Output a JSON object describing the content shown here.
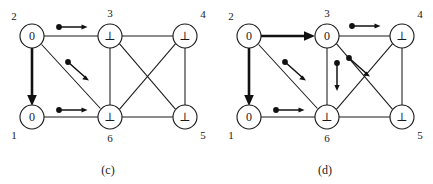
{
  "figure": {
    "background_color": "#ffffff",
    "ink_color": "#1a1a1a",
    "panels": [
      {
        "id": "c",
        "caption": "(c)",
        "nodes": [
          {
            "id": "2",
            "value": "0",
            "cx": 32,
            "cy": 36,
            "r": 12,
            "label_x": 14,
            "label_y": 17
          },
          {
            "id": "3",
            "value": "⊥",
            "cx": 110,
            "cy": 36,
            "r": 12,
            "label_x": 110,
            "label_y": 14
          },
          {
            "id": "4",
            "value": "⊥",
            "cx": 185,
            "cy": 36,
            "r": 12,
            "label_x": 203,
            "label_y": 15
          },
          {
            "id": "1",
            "value": "0",
            "cx": 32,
            "cy": 117,
            "r": 12,
            "label_x": 14,
            "label_y": 136
          },
          {
            "id": "6",
            "value": "⊥",
            "cx": 110,
            "cy": 117,
            "r": 12,
            "label_x": 110,
            "label_y": 139
          },
          {
            "id": "5",
            "value": "⊥",
            "cx": 185,
            "cy": 117,
            "r": 12,
            "label_x": 203,
            "label_y": 136
          }
        ],
        "edges": [
          {
            "from": "2",
            "to": "3",
            "style": "plain"
          },
          {
            "from": "3",
            "to": "4",
            "style": "plain"
          },
          {
            "from": "2",
            "to": "6",
            "style": "plain"
          },
          {
            "from": "3",
            "to": "6",
            "style": "plain"
          },
          {
            "from": "3",
            "to": "5",
            "style": "plain"
          },
          {
            "from": "4",
            "to": "6",
            "style": "plain"
          },
          {
            "from": "4",
            "to": "5",
            "style": "plain"
          },
          {
            "from": "1",
            "to": "6",
            "style": "plain"
          },
          {
            "from": "6",
            "to": "5",
            "style": "plain"
          },
          {
            "from": "2",
            "to": "1",
            "style": "bold-arrow"
          }
        ],
        "message_arrows": [
          {
            "from": "2",
            "to": "3",
            "direction": "right",
            "x1": 57,
            "y1": 27,
            "x2": 85,
            "y2": 27
          },
          {
            "from": "2",
            "to": "6",
            "direction": "down-right",
            "x1": 67,
            "y1": 61,
            "x2": 88,
            "y2": 79
          },
          {
            "from": "1",
            "to": "6",
            "direction": "right",
            "x1": 57,
            "y1": 110,
            "x2": 85,
            "y2": 110
          }
        ]
      },
      {
        "id": "d",
        "caption": "(d)",
        "nodes": [
          {
            "id": "2",
            "value": "0",
            "cx": 32,
            "cy": 36,
            "r": 12,
            "label_x": 14,
            "label_y": 17
          },
          {
            "id": "3",
            "value": "0",
            "cx": 110,
            "cy": 36,
            "r": 12,
            "label_x": 110,
            "label_y": 14
          },
          {
            "id": "4",
            "value": "⊥",
            "cx": 185,
            "cy": 36,
            "r": 12,
            "label_x": 203,
            "label_y": 15
          },
          {
            "id": "1",
            "value": "0",
            "cx": 32,
            "cy": 117,
            "r": 12,
            "label_x": 14,
            "label_y": 136
          },
          {
            "id": "6",
            "value": "⊥",
            "cx": 110,
            "cy": 117,
            "r": 12,
            "label_x": 110,
            "label_y": 139
          },
          {
            "id": "5",
            "value": "⊥",
            "cx": 185,
            "cy": 117,
            "r": 12,
            "label_x": 203,
            "label_y": 136
          }
        ],
        "edges": [
          {
            "from": "3",
            "to": "4",
            "style": "plain"
          },
          {
            "from": "2",
            "to": "6",
            "style": "plain"
          },
          {
            "from": "3",
            "to": "6",
            "style": "plain"
          },
          {
            "from": "3",
            "to": "5",
            "style": "plain"
          },
          {
            "from": "4",
            "to": "6",
            "style": "plain"
          },
          {
            "from": "4",
            "to": "5",
            "style": "plain"
          },
          {
            "from": "1",
            "to": "6",
            "style": "plain"
          },
          {
            "from": "6",
            "to": "5",
            "style": "plain"
          },
          {
            "from": "2",
            "to": "1",
            "style": "bold-arrow"
          },
          {
            "from": "2",
            "to": "3",
            "style": "bold-arrow"
          }
        ],
        "message_arrows": [
          {
            "from": "3",
            "to": "4",
            "direction": "right",
            "x1": 133,
            "y1": 26,
            "x2": 161,
            "y2": 26
          },
          {
            "from": "2",
            "to": "6",
            "direction": "down-right",
            "x1": 67,
            "y1": 61,
            "x2": 88,
            "y2": 79
          },
          {
            "from": "1",
            "to": "6",
            "direction": "right",
            "x1": 57,
            "y1": 110,
            "x2": 85,
            "y2": 110
          },
          {
            "from": "3",
            "to": "5",
            "direction": "down-right",
            "x1": 131,
            "y1": 57,
            "x2": 152,
            "y2": 75
          },
          {
            "from": "3",
            "to": "6",
            "direction": "down",
            "x1": 120,
            "y1": 62,
            "x2": 120,
            "y2": 91
          }
        ]
      }
    ]
  }
}
